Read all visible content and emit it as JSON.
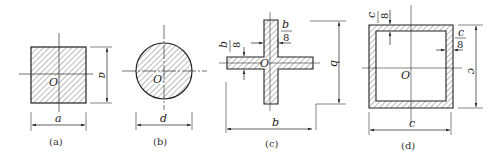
{
  "figures": [
    {
      "id": "a",
      "shape": "solid-square",
      "caption": "(a)",
      "center_label": "O",
      "width_label": "a",
      "height_label": "a"
    },
    {
      "id": "b",
      "shape": "solid-circle",
      "caption": "(b)",
      "center_label": "O",
      "diameter_label": "d"
    },
    {
      "id": "c",
      "shape": "cross",
      "caption": "(c)",
      "center_label": "O",
      "width_label": "b",
      "height_label": "b",
      "thickness_num": "b",
      "thickness_den": "8",
      "thickness_v_num": "b",
      "thickness_v_den": "8"
    },
    {
      "id": "d",
      "shape": "hollow-square",
      "caption": "(d)",
      "center_label": "O",
      "width_label": "c",
      "height_label": "c",
      "thickness_num": "c",
      "thickness_den": "8",
      "thickness_top_num": "c",
      "thickness_top_den": "8"
    }
  ],
  "colors": {
    "stroke": "#222222",
    "hatch": "#444444",
    "background": "#ffffff"
  }
}
